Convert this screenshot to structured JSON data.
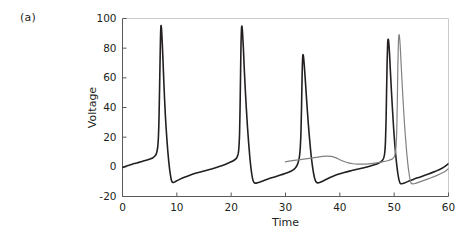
{
  "figure": {
    "panel_label": "(a)",
    "background": "#ffffff"
  },
  "chart_data": {
    "type": "line",
    "title": "",
    "xlabel": "Time",
    "ylabel": "Voltage",
    "xlim": [
      0,
      60
    ],
    "ylim": [
      -20,
      100
    ],
    "xticks": [
      0,
      10,
      20,
      30,
      40,
      50,
      60
    ],
    "xticklabels": [
      "0",
      "10",
      "20",
      "30",
      "40",
      "50",
      "60"
    ],
    "yticks": [
      -20,
      0,
      20,
      40,
      60,
      80,
      100
    ],
    "yticklabels": [
      "-20",
      "0",
      "20",
      "40",
      "60",
      "80",
      "100"
    ],
    "grid": false,
    "legend": null,
    "axis_color": "#58595b",
    "series": [
      {
        "name": "neuron-1",
        "color": "#231f20",
        "linewidth": 1.6,
        "peaks": [
          {
            "x": 7.0,
            "y": 95.0
          },
          {
            "x": 21.5,
            "y": 94.5
          },
          {
            "x": 33.0,
            "y": 75.5
          },
          {
            "x": 48.4,
            "y": 86.0
          }
        ],
        "troughs": [
          {
            "x": 9.2,
            "y": -10.5
          },
          {
            "x": 23.6,
            "y": -11.0
          },
          {
            "x": 35.0,
            "y": -10.8
          },
          {
            "x": 50.2,
            "y": -11.2
          }
        ],
        "points": [
          [
            0.0,
            -0.5
          ],
          [
            0.6,
            0.4
          ],
          [
            1.2,
            1.1
          ],
          [
            1.8,
            1.8
          ],
          [
            2.4,
            2.4
          ],
          [
            3.0,
            3.0
          ],
          [
            3.6,
            3.6
          ],
          [
            4.2,
            4.2
          ],
          [
            4.8,
            4.9
          ],
          [
            5.3,
            5.6
          ],
          [
            5.7,
            6.4
          ],
          [
            6.0,
            7.4
          ],
          [
            6.2,
            8.6
          ],
          [
            6.35,
            10.5
          ],
          [
            6.5,
            14.0
          ],
          [
            6.62,
            21.0
          ],
          [
            6.72,
            33.0
          ],
          [
            6.82,
            52.0
          ],
          [
            6.92,
            73.0
          ],
          [
            7.0,
            88.0
          ],
          [
            7.08,
            95.0
          ],
          [
            7.18,
            93.0
          ],
          [
            7.3,
            85.0
          ],
          [
            7.45,
            72.0
          ],
          [
            7.6,
            58.0
          ],
          [
            7.75,
            45.0
          ],
          [
            7.9,
            34.0
          ],
          [
            8.05,
            25.0
          ],
          [
            8.2,
            17.0
          ],
          [
            8.35,
            10.0
          ],
          [
            8.5,
            4.0
          ],
          [
            8.65,
            -1.0
          ],
          [
            8.8,
            -5.0
          ],
          [
            8.95,
            -8.2
          ],
          [
            9.1,
            -10.0
          ],
          [
            9.3,
            -10.6
          ],
          [
            9.6,
            -10.2
          ],
          [
            10.0,
            -9.4
          ],
          [
            10.6,
            -8.3
          ],
          [
            11.4,
            -7.0
          ],
          [
            12.4,
            -5.6
          ],
          [
            13.6,
            -4.2
          ],
          [
            15.0,
            -2.8
          ],
          [
            16.4,
            -1.4
          ],
          [
            17.8,
            0.2
          ],
          [
            19.0,
            1.8
          ],
          [
            19.9,
            3.2
          ],
          [
            20.6,
            4.6
          ],
          [
            21.0,
            6.0
          ],
          [
            21.2,
            7.6
          ],
          [
            21.35,
            10.0
          ],
          [
            21.45,
            14.5
          ],
          [
            21.55,
            23.0
          ],
          [
            21.63,
            38.0
          ],
          [
            21.72,
            60.0
          ],
          [
            21.8,
            80.0
          ],
          [
            21.9,
            93.0
          ],
          [
            22.0,
            94.5
          ],
          [
            22.1,
            90.0
          ],
          [
            22.25,
            80.0
          ],
          [
            22.4,
            67.0
          ],
          [
            22.6,
            52.0
          ],
          [
            22.8,
            39.0
          ],
          [
            23.0,
            27.0
          ],
          [
            23.2,
            17.0
          ],
          [
            23.4,
            8.0
          ],
          [
            23.6,
            0.5
          ],
          [
            23.8,
            -5.0
          ],
          [
            24.0,
            -8.8
          ],
          [
            24.2,
            -10.6
          ],
          [
            24.5,
            -11.0
          ],
          [
            25.0,
            -10.5
          ],
          [
            25.8,
            -9.5
          ],
          [
            26.8,
            -8.2
          ],
          [
            28.0,
            -6.8
          ],
          [
            29.2,
            -5.4
          ],
          [
            30.2,
            -4.2
          ],
          [
            31.0,
            -3.0
          ],
          [
            31.6,
            -1.6
          ],
          [
            32.0,
            0.2
          ],
          [
            32.3,
            2.6
          ],
          [
            32.55,
            6.5
          ],
          [
            32.72,
            13.0
          ],
          [
            32.85,
            24.0
          ],
          [
            32.95,
            40.0
          ],
          [
            33.05,
            60.0
          ],
          [
            33.15,
            73.0
          ],
          [
            33.25,
            75.5
          ],
          [
            33.4,
            71.0
          ],
          [
            33.6,
            61.0
          ],
          [
            33.8,
            50.0
          ],
          [
            34.0,
            39.0
          ],
          [
            34.2,
            29.0
          ],
          [
            34.4,
            20.0
          ],
          [
            34.6,
            12.0
          ],
          [
            34.8,
            5.0
          ],
          [
            35.0,
            -0.5
          ],
          [
            35.2,
            -5.0
          ],
          [
            35.4,
            -8.2
          ],
          [
            35.6,
            -10.0
          ],
          [
            35.9,
            -10.8
          ],
          [
            36.4,
            -10.4
          ],
          [
            37.2,
            -9.0
          ],
          [
            38.2,
            -7.2
          ],
          [
            39.4,
            -5.4
          ],
          [
            40.8,
            -3.8
          ],
          [
            42.2,
            -2.5
          ],
          [
            43.6,
            -1.3
          ],
          [
            45.0,
            -0.1
          ],
          [
            46.2,
            1.2
          ],
          [
            47.2,
            2.6
          ],
          [
            47.8,
            4.2
          ],
          [
            48.1,
            6.2
          ],
          [
            48.28,
            10.0
          ],
          [
            48.4,
            17.0
          ],
          [
            48.5,
            30.0
          ],
          [
            48.6,
            50.0
          ],
          [
            48.7,
            70.0
          ],
          [
            48.8,
            83.0
          ],
          [
            48.88,
            86.0
          ],
          [
            49.0,
            84.0
          ],
          [
            49.15,
            76.0
          ],
          [
            49.3,
            65.0
          ],
          [
            49.5,
            51.0
          ],
          [
            49.7,
            38.0
          ],
          [
            49.9,
            26.0
          ],
          [
            50.1,
            16.0
          ],
          [
            50.3,
            7.5
          ],
          [
            50.5,
            0.5
          ],
          [
            50.7,
            -5.0
          ],
          [
            50.9,
            -9.0
          ],
          [
            51.1,
            -11.0
          ],
          [
            51.4,
            -11.4
          ],
          [
            51.9,
            -10.9
          ],
          [
            52.6,
            -9.8
          ],
          [
            53.6,
            -8.3
          ],
          [
            54.8,
            -6.8
          ],
          [
            56.2,
            -5.0
          ],
          [
            57.6,
            -3.0
          ],
          [
            58.8,
            -1.0
          ],
          [
            59.6,
            1.0
          ],
          [
            60.0,
            2.2
          ]
        ]
      },
      {
        "name": "neuron-2",
        "color": "#808080",
        "linewidth": 1.2,
        "peaks": [
          {
            "x": 37.8,
            "y": 7.2
          },
          {
            "x": 50.6,
            "y": 89.0
          }
        ],
        "troughs": [
          {
            "x": 53.0,
            "y": -11.5
          }
        ],
        "start_x": 30.0,
        "points": [
          [
            30.0,
            3.4
          ],
          [
            31.0,
            4.0
          ],
          [
            32.0,
            4.5
          ],
          [
            33.0,
            5.0
          ],
          [
            34.0,
            5.5
          ],
          [
            35.0,
            6.0
          ],
          [
            36.0,
            6.6
          ],
          [
            36.8,
            7.0
          ],
          [
            37.6,
            7.2
          ],
          [
            38.4,
            7.0
          ],
          [
            39.2,
            6.2
          ],
          [
            40.0,
            4.8
          ],
          [
            40.8,
            3.6
          ],
          [
            41.6,
            2.7
          ],
          [
            42.4,
            2.1
          ],
          [
            43.2,
            1.8
          ],
          [
            44.2,
            1.8
          ],
          [
            45.2,
            2.0
          ],
          [
            46.4,
            2.5
          ],
          [
            47.6,
            3.2
          ],
          [
            48.8,
            4.1
          ],
          [
            49.6,
            5.2
          ],
          [
            50.0,
            6.6
          ],
          [
            50.2,
            9.0
          ],
          [
            50.35,
            14.0
          ],
          [
            50.48,
            25.0
          ],
          [
            50.58,
            45.0
          ],
          [
            50.68,
            68.0
          ],
          [
            50.78,
            84.0
          ],
          [
            50.88,
            89.0
          ],
          [
            51.0,
            87.0
          ],
          [
            51.15,
            79.0
          ],
          [
            51.3,
            68.0
          ],
          [
            51.5,
            54.0
          ],
          [
            51.7,
            41.0
          ],
          [
            51.9,
            29.0
          ],
          [
            52.1,
            19.0
          ],
          [
            52.3,
            10.0
          ],
          [
            52.5,
            2.5
          ],
          [
            52.7,
            -3.5
          ],
          [
            52.9,
            -8.0
          ],
          [
            53.1,
            -10.8
          ],
          [
            53.4,
            -11.5
          ],
          [
            53.9,
            -11.2
          ],
          [
            54.6,
            -10.3
          ],
          [
            55.6,
            -9.0
          ],
          [
            56.8,
            -7.4
          ],
          [
            58.0,
            -5.6
          ],
          [
            59.0,
            -3.8
          ],
          [
            59.6,
            -2.4
          ],
          [
            60.0,
            -1.2
          ]
        ]
      }
    ]
  }
}
